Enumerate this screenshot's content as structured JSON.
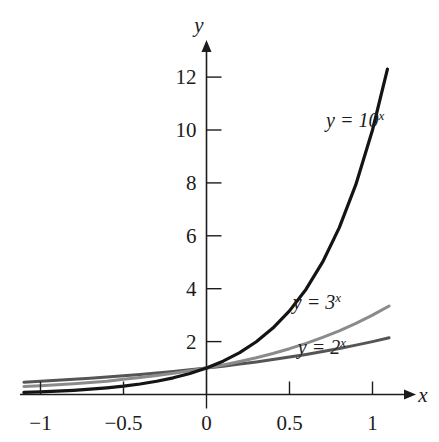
{
  "figure": {
    "background_color": "#ffffff",
    "axis_color": "#1c1c1c"
  },
  "chart_data": {
    "type": "line",
    "title": "",
    "subtitle": "",
    "xlabel": "x",
    "ylabel": "y",
    "grid": false,
    "legend_position": "inline-annotation",
    "xlim": [
      -1.1,
      1.12
    ],
    "ylim": [
      -0.35,
      13.2
    ],
    "xticks": [
      -1,
      -0.5,
      0,
      0.5,
      1
    ],
    "xtick_labels": [
      "−1",
      "−0.5",
      "0",
      "0.5",
      "1"
    ],
    "yticks": [
      2,
      4,
      6,
      8,
      10,
      12
    ],
    "ytick_labels": [
      "2",
      "4",
      "6",
      "8",
      "10",
      "12"
    ],
    "series": [
      {
        "name": "y = 2^x",
        "base": 2,
        "color": "#555555",
        "linewidth": 3.0,
        "x": [
          -1.1,
          -1.0,
          -0.9,
          -0.8,
          -0.7,
          -0.6,
          -0.5,
          -0.4,
          -0.3,
          -0.2,
          -0.1,
          0.0,
          0.1,
          0.2,
          0.3,
          0.4,
          0.5,
          0.6,
          0.7,
          0.8,
          0.9,
          1.0,
          1.1
        ],
        "values": [
          0.466,
          0.5,
          0.536,
          0.574,
          0.616,
          0.66,
          0.707,
          0.758,
          0.812,
          0.871,
          0.933,
          1.0,
          1.072,
          1.149,
          1.231,
          1.32,
          1.414,
          1.516,
          1.625,
          1.741,
          1.866,
          2.0,
          2.144
        ]
      },
      {
        "name": "y = 3^x",
        "base": 3,
        "color": "#8b8b8b",
        "linewidth": 3.0,
        "x": [
          -1.1,
          -1.0,
          -0.9,
          -0.8,
          -0.7,
          -0.6,
          -0.5,
          -0.4,
          -0.3,
          -0.2,
          -0.1,
          0.0,
          0.1,
          0.2,
          0.3,
          0.4,
          0.5,
          0.6,
          0.7,
          0.8,
          0.9,
          1.0,
          1.1
        ],
        "values": [
          0.302,
          0.333,
          0.368,
          0.407,
          0.45,
          0.497,
          0.577,
          0.644,
          0.719,
          0.803,
          0.896,
          1.0,
          1.116,
          1.246,
          1.39,
          1.552,
          1.732,
          1.933,
          2.158,
          2.408,
          2.688,
          3.0,
          3.348
        ]
      },
      {
        "name": "y = 10^x",
        "base": 10,
        "color": "#141414",
        "linewidth": 3.2,
        "x": [
          -1.1,
          -1.0,
          -0.9,
          -0.8,
          -0.7,
          -0.6,
          -0.5,
          -0.4,
          -0.3,
          -0.2,
          -0.1,
          0.0,
          0.1,
          0.2,
          0.3,
          0.4,
          0.5,
          0.6,
          0.7,
          0.8,
          0.9,
          1.0,
          1.09
        ],
        "values": [
          0.079,
          0.1,
          0.126,
          0.158,
          0.2,
          0.251,
          0.316,
          0.398,
          0.501,
          0.631,
          0.794,
          1.0,
          1.259,
          1.585,
          1.995,
          2.512,
          3.162,
          3.981,
          5.012,
          6.31,
          7.943,
          10.0,
          12.3
        ]
      }
    ],
    "annotations": [
      {
        "id": "label-10x",
        "text_base": "y = 10",
        "exponent": "x",
        "x": 0.72,
        "y": 10.1
      },
      {
        "id": "label-3x",
        "text_base": "y = 3",
        "exponent": "x",
        "x": 0.52,
        "y": 3.25
      },
      {
        "id": "label-2x",
        "text_base": "y = 2",
        "exponent": "x",
        "x": 0.55,
        "y": 1.52
      }
    ]
  }
}
